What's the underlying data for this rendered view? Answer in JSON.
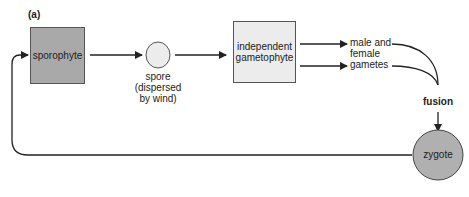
{
  "figure": {
    "panel_label": "(a)",
    "nodes": {
      "sporophyte": {
        "label": "sporophyte",
        "fill": "#a9a9a9"
      },
      "spore": {
        "label_line1": "spore",
        "label_line2": "(dispersed",
        "label_line3": "by wind)",
        "fill": "#ececec"
      },
      "gametophyte": {
        "label_line1": "independent",
        "label_line2": "gametophyte",
        "fill": "#ececec"
      },
      "gametes": {
        "label_line1": "male and",
        "label_line2": "female",
        "label_line3": "gametes"
      },
      "fusion": {
        "label": "fusion"
      },
      "zygote": {
        "label": "zygote",
        "fill": "#b0b0b0"
      }
    }
  }
}
